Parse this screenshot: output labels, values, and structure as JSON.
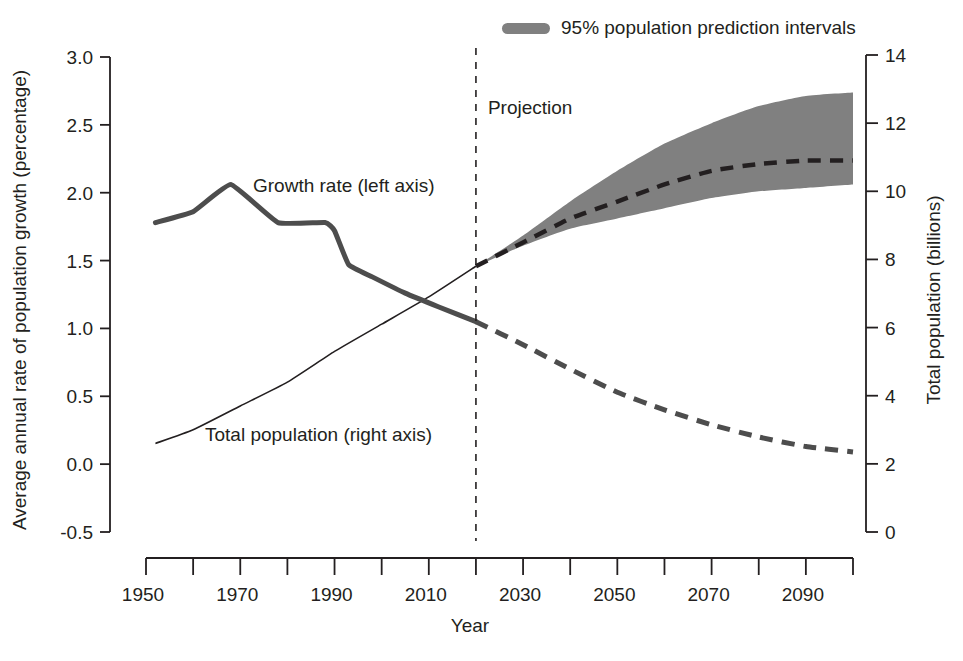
{
  "chart_data": {
    "type": "line",
    "title": "",
    "xlabel": "Year",
    "ylabel_left": "Average annual rate of population growth (percentage)",
    "ylabel_right": "Total population (billions)",
    "xlim": [
      1950,
      2100
    ],
    "xticks_major": [
      1950,
      1970,
      1990,
      2010,
      2030,
      2050,
      2070,
      2090
    ],
    "xtick_labels": [
      "1950",
      "1970",
      "1990",
      "2010",
      "2030",
      "2050",
      "2070",
      "2090"
    ],
    "xticks_all": [
      1950,
      1960,
      1970,
      1980,
      1990,
      2000,
      2010,
      2020,
      2030,
      2040,
      2050,
      2060,
      2070,
      2080,
      2090,
      2100
    ],
    "ylim_left": [
      -0.5,
      3.0
    ],
    "yticks_left": [
      -0.5,
      0.0,
      0.5,
      1.0,
      1.5,
      2.0,
      2.5,
      3.0
    ],
    "ytick_labels_left": [
      "-0.5",
      "0.0",
      "0.5",
      "1.0",
      "1.5",
      "2.0",
      "2.5",
      "3.0"
    ],
    "ylim_right": [
      0,
      14
    ],
    "yticks_right": [
      0,
      2,
      4,
      6,
      8,
      10,
      12,
      14
    ],
    "ytick_labels_right": [
      "0",
      "2",
      "4",
      "6",
      "8",
      "10",
      "12",
      "14"
    ],
    "grid": false,
    "legend_position": "top-center",
    "projection_start_year": 2020,
    "projection_annotation": "Projection",
    "legend": [
      {
        "label": "95% population prediction intervals",
        "swatch": "band",
        "color": "#808080"
      }
    ],
    "series": [
      {
        "name": "Growth rate (left axis)",
        "axis": "left",
        "unit": "percentage",
        "style": "solid-thick",
        "color": "#4d4d4d",
        "label_text": "Growth rate (left axis)",
        "label_x": 1990,
        "label_y": 2.08,
        "points": [
          {
            "x": 1952,
            "y": 1.78
          },
          {
            "x": 1960,
            "y": 1.86
          },
          {
            "x": 1968,
            "y": 2.06
          },
          {
            "x": 1978,
            "y": 1.78
          },
          {
            "x": 1988,
            "y": 1.78
          },
          {
            "x": 1990,
            "y": 1.72
          },
          {
            "x": 1993,
            "y": 1.47
          },
          {
            "x": 1998,
            "y": 1.38
          },
          {
            "x": 2005,
            "y": 1.26
          },
          {
            "x": 2012,
            "y": 1.16
          },
          {
            "x": 2020,
            "y": 1.05
          }
        ]
      },
      {
        "name": "Growth rate projection",
        "axis": "left",
        "unit": "percentage",
        "style": "dashed-thick",
        "color": "#4d4d4d",
        "points": [
          {
            "x": 2020,
            "y": 1.05
          },
          {
            "x": 2030,
            "y": 0.88
          },
          {
            "x": 2040,
            "y": 0.7
          },
          {
            "x": 2050,
            "y": 0.53
          },
          {
            "x": 2060,
            "y": 0.4
          },
          {
            "x": 2070,
            "y": 0.29
          },
          {
            "x": 2080,
            "y": 0.2
          },
          {
            "x": 2090,
            "y": 0.13
          },
          {
            "x": 2100,
            "y": 0.09
          }
        ]
      },
      {
        "name": "Total population (right axis)",
        "axis": "right",
        "unit": "billions",
        "style": "solid-thin",
        "color": "#231f20",
        "label_text": "Total population (right axis)",
        "label_x": 1978,
        "label_y": 2.8,
        "points": [
          {
            "x": 1952,
            "y": 2.6
          },
          {
            "x": 1960,
            "y": 3.0
          },
          {
            "x": 1970,
            "y": 3.7
          },
          {
            "x": 1980,
            "y": 4.4
          },
          {
            "x": 1990,
            "y": 5.3
          },
          {
            "x": 2000,
            "y": 6.1
          },
          {
            "x": 2010,
            "y": 6.9
          },
          {
            "x": 2020,
            "y": 7.8
          }
        ]
      },
      {
        "name": "Total population projection (median)",
        "axis": "right",
        "unit": "billions",
        "style": "dashed-thick",
        "color": "#231f20",
        "points": [
          {
            "x": 2020,
            "y": 7.8
          },
          {
            "x": 2030,
            "y": 8.5
          },
          {
            "x": 2040,
            "y": 9.2
          },
          {
            "x": 2050,
            "y": 9.7
          },
          {
            "x": 2060,
            "y": 10.2
          },
          {
            "x": 2070,
            "y": 10.6
          },
          {
            "x": 2080,
            "y": 10.8
          },
          {
            "x": 2090,
            "y": 10.9
          },
          {
            "x": 2100,
            "y": 10.9
          }
        ]
      }
    ],
    "band": {
      "name": "95% population prediction intervals",
      "axis": "right",
      "unit": "billions",
      "color": "#808080",
      "upper": [
        {
          "x": 2020,
          "y": 7.8
        },
        {
          "x": 2030,
          "y": 8.7
        },
        {
          "x": 2040,
          "y": 9.7
        },
        {
          "x": 2050,
          "y": 10.6
        },
        {
          "x": 2060,
          "y": 11.4
        },
        {
          "x": 2070,
          "y": 12.0
        },
        {
          "x": 2080,
          "y": 12.5
        },
        {
          "x": 2090,
          "y": 12.8
        },
        {
          "x": 2100,
          "y": 12.9
        }
      ],
      "lower": [
        {
          "x": 2020,
          "y": 7.8
        },
        {
          "x": 2030,
          "y": 8.4
        },
        {
          "x": 2040,
          "y": 8.9
        },
        {
          "x": 2050,
          "y": 9.2
        },
        {
          "x": 2060,
          "y": 9.5
        },
        {
          "x": 2070,
          "y": 9.8
        },
        {
          "x": 2080,
          "y": 10.0
        },
        {
          "x": 2090,
          "y": 10.1
        },
        {
          "x": 2100,
          "y": 10.2
        }
      ]
    }
  }
}
